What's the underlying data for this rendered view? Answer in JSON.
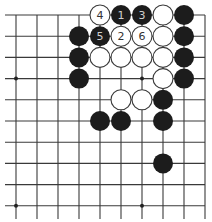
{
  "board": {
    "cols": 10,
    "rows": 10,
    "origin_x": 16,
    "origin_y": 15,
    "spacing_x": 21.0,
    "spacing_y": 21.2,
    "edges": {
      "top": true,
      "right": true,
      "left": false,
      "bottom": false
    },
    "star_points": [
      [
        0,
        3
      ],
      [
        6,
        3
      ],
      [
        0,
        9
      ],
      [
        6,
        9
      ]
    ],
    "colors": {
      "black": "#1c1c1c",
      "white": "#ffffff",
      "line": "#3a3a3a"
    }
  },
  "stones": [
    {
      "col": 4,
      "row": 0,
      "color": "white",
      "label": "4"
    },
    {
      "col": 5,
      "row": 0,
      "color": "black",
      "label": "1"
    },
    {
      "col": 6,
      "row": 0,
      "color": "black",
      "label": "3"
    },
    {
      "col": 7,
      "row": 0,
      "color": "white",
      "label": ""
    },
    {
      "col": 8,
      "row": 0,
      "color": "black",
      "label": ""
    },
    {
      "col": 3,
      "row": 1,
      "color": "black",
      "label": ""
    },
    {
      "col": 4,
      "row": 1,
      "color": "black",
      "label": "5"
    },
    {
      "col": 5,
      "row": 1,
      "color": "white",
      "label": "2"
    },
    {
      "col": 6,
      "row": 1,
      "color": "white",
      "label": "6"
    },
    {
      "col": 7,
      "row": 1,
      "color": "white",
      "label": ""
    },
    {
      "col": 8,
      "row": 1,
      "color": "black",
      "label": ""
    },
    {
      "col": 3,
      "row": 2,
      "color": "black",
      "label": ""
    },
    {
      "col": 4,
      "row": 2,
      "color": "white",
      "label": ""
    },
    {
      "col": 5,
      "row": 2,
      "color": "white",
      "label": ""
    },
    {
      "col": 6,
      "row": 2,
      "color": "white",
      "label": ""
    },
    {
      "col": 7,
      "row": 2,
      "color": "white",
      "label": ""
    },
    {
      "col": 8,
      "row": 2,
      "color": "black",
      "label": ""
    },
    {
      "col": 3,
      "row": 3,
      "color": "black",
      "label": ""
    },
    {
      "col": 7,
      "row": 3,
      "color": "white",
      "label": ""
    },
    {
      "col": 8,
      "row": 3,
      "color": "black",
      "label": ""
    },
    {
      "col": 5,
      "row": 4,
      "color": "white",
      "label": ""
    },
    {
      "col": 6,
      "row": 4,
      "color": "white",
      "label": ""
    },
    {
      "col": 7,
      "row": 4,
      "color": "black",
      "label": ""
    },
    {
      "col": 4,
      "row": 5,
      "color": "black",
      "label": ""
    },
    {
      "col": 5,
      "row": 5,
      "color": "black",
      "label": ""
    },
    {
      "col": 7,
      "row": 5,
      "color": "black",
      "label": ""
    },
    {
      "col": 7,
      "row": 7,
      "color": "black",
      "label": ""
    }
  ]
}
